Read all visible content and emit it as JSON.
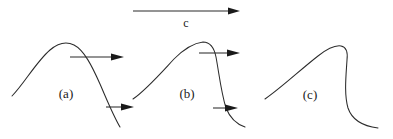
{
  "figure": {
    "caption_labels": [
      {
        "id": "panel-a",
        "text": "(a)",
        "x": 66,
        "y": 98
      },
      {
        "id": "panel-b",
        "text": "(b)",
        "x": 187,
        "y": 98
      },
      {
        "id": "panel-c",
        "text": "(c)",
        "x": 310,
        "y": 99
      }
    ],
    "speed_arrow": {
      "label": "c",
      "label_x": 186,
      "label_y": 27,
      "shaft": {
        "x1": 133,
        "y1": 11,
        "x2": 232,
        "y2": 11
      },
      "head": {
        "tip_x": 240,
        "tip_y": 11,
        "back_x": 228,
        "half_height": 3.4
      }
    },
    "panels": [
      {
        "id": "panel-a",
        "name": "sinusoidal-wave",
        "curve": "M 12 96 C 24 84, 36 62, 50 50 C 57 44, 66 41, 74 45 C 84 50, 92 66, 100 84 C 107 100, 113 115, 120 127",
        "arrows": [
          {
            "id": "crest-velocity-arrow-a",
            "shaft": {
              "x1": 70,
              "y1": 57,
              "x2": 114,
              "y2": 57
            },
            "head": {
              "tip_x": 124,
              "tip_y": 57,
              "back_x": 111,
              "half_height": 3.6
            }
          },
          {
            "id": "trough-velocity-arrow-a",
            "shaft": {
              "x1": 106,
              "y1": 107,
              "x2": 124,
              "y2": 107
            },
            "head": {
              "tip_x": 134,
              "tip_y": 107,
              "back_x": 121,
              "half_height": 3.6
            }
          }
        ]
      },
      {
        "id": "panel-b",
        "name": "steepened-wave",
        "curve": "M 133 99 C 146 90, 160 74, 174 59 C 184 49, 194 43, 203 42 C 210 42, 214 47, 216 57 C 219 73, 221 92, 226 108 C 230 118, 236 124, 245 127",
        "arrows": [
          {
            "id": "crest-velocity-arrow-b",
            "shaft": {
              "x1": 199,
              "y1": 53,
              "x2": 230,
              "y2": 53
            },
            "head": {
              "tip_x": 240,
              "tip_y": 53,
              "back_x": 227,
              "half_height": 3.6
            }
          },
          {
            "id": "trough-velocity-arrow-b",
            "shaft": {
              "x1": 213,
              "y1": 108,
              "x2": 228,
              "y2": 108
            },
            "head": {
              "tip_x": 238,
              "tip_y": 108,
              "back_x": 225,
              "half_height": 3.6
            }
          }
        ]
      },
      {
        "id": "panel-c",
        "name": "breaking-wave",
        "curve": "M 265 99 C 281 88, 300 70, 318 56 C 327 49, 335 45, 341 46 C 346 47, 348 52, 347 60 C 346 76, 344 94, 348 108 C 352 120, 362 126, 378 128",
        "arrows": []
      }
    ]
  },
  "colors": {
    "curve_stroke": "#2b2b2b",
    "arrow_fill": "#1a1a1a",
    "background": "#ffffff"
  }
}
